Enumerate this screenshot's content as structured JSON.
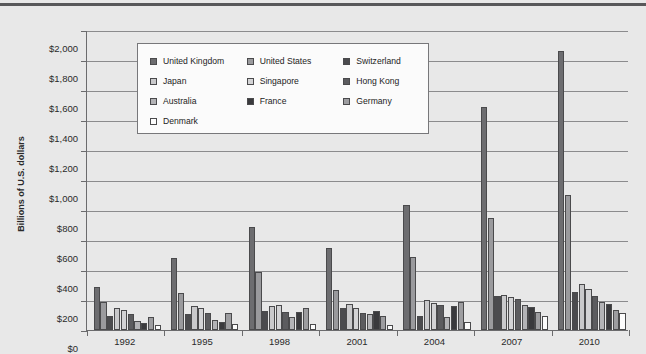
{
  "chart_data": {
    "type": "bar",
    "title": "",
    "xlabel": "",
    "ylabel": "Billions of U.S. dollars",
    "ylim": [
      0,
      2000
    ],
    "ytick_labels": [
      "$0",
      "$200",
      "$400",
      "$600",
      "$800",
      "$1,000",
      "$1,200",
      "$1,400",
      "$1,600",
      "$1,800",
      "$2,000"
    ],
    "ytick_values": [
      0,
      200,
      400,
      600,
      800,
      1000,
      1200,
      1400,
      1600,
      1800,
      2000
    ],
    "grid": true,
    "legend_position": "upper-center",
    "categories": [
      "1992",
      "1995",
      "1998",
      "2001",
      "2004",
      "2007",
      "2010"
    ],
    "series": [
      {
        "name": "United Kingdom",
        "color": "#6d6d70",
        "values": [
          290,
          480,
          685,
          545,
          835,
          1485,
          1860
        ]
      },
      {
        "name": "United States",
        "color": "#9a9a9d",
        "values": [
          185,
          250,
          390,
          265,
          490,
          750,
          900
        ]
      },
      {
        "name": "Switzerland",
        "color": "#4b4b4e",
        "values": [
          95,
          110,
          130,
          150,
          95,
          230,
          255
        ]
      },
      {
        "name": "Japan",
        "color": "#c9c9cb",
        "values": [
          145,
          160,
          160,
          175,
          200,
          235,
          305
        ]
      },
      {
        "name": "Singapore",
        "color": "#d3d3d5",
        "values": [
          135,
          145,
          165,
          150,
          180,
          220,
          275
        ]
      },
      {
        "name": "Hong Kong",
        "color": "#5c5c5f",
        "values": [
          105,
          115,
          120,
          115,
          165,
          205,
          230
        ]
      },
      {
        "name": "Australia",
        "color": "#b3b3b6",
        "values": [
          60,
          65,
          85,
          105,
          90,
          165,
          190
        ]
      },
      {
        "name": "France",
        "color": "#3a3a3d",
        "values": [
          45,
          55,
          120,
          125,
          160,
          155,
          175
        ]
      },
      {
        "name": "Germany",
        "color": "#9d9da0",
        "values": [
          90,
          115,
          145,
          95,
          190,
          120,
          135
        ]
      },
      {
        "name": "Denmark",
        "color": "#fcfcfc",
        "values": [
          35,
          40,
          40,
          35,
          55,
          95,
          115
        ]
      }
    ]
  },
  "legend": {
    "entries": [
      {
        "label": "United Kingdom"
      },
      {
        "label": "United States"
      },
      {
        "label": "Switzerland"
      },
      {
        "label": "Japan"
      },
      {
        "label": "Singapore"
      },
      {
        "label": "Hong Kong"
      },
      {
        "label": "Australia"
      },
      {
        "label": "France"
      },
      {
        "label": "Germany"
      },
      {
        "label": "Denmark"
      }
    ]
  }
}
